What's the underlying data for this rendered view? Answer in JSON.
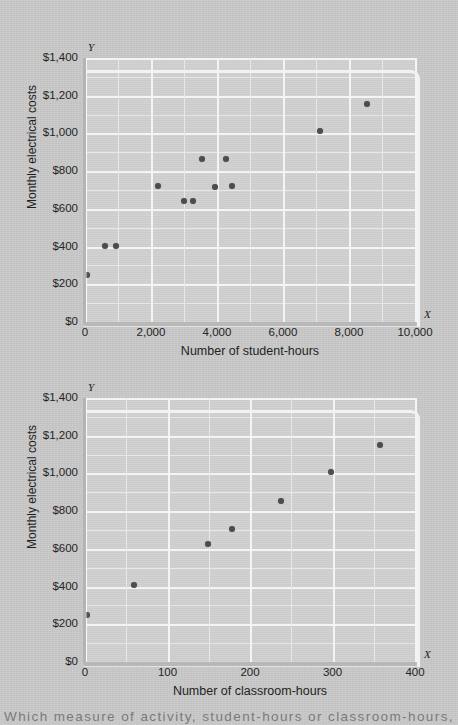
{
  "page": {
    "background_color": "#c9c9c9",
    "plot_background_color": "#d0d0d0",
    "gridline_color": "#f4f4f4",
    "dot_color": "#4d4d4d",
    "axis_color": "#b8b8b8"
  },
  "bottom_caption": "Which measure of activity, student-hours or classroom-hours, has a higher",
  "chart_data": [
    {
      "id": "chart-student-hours",
      "type": "scatter",
      "title": "",
      "xlabel": "Number of student-hours",
      "ylabel": "Monthly electrical costs",
      "x_axis_letter": "X",
      "y_axis_letter": "Y",
      "xlim": [
        0,
        10000
      ],
      "ylim": [
        0,
        1400
      ],
      "grid": true,
      "legend": "none",
      "xticks": [
        0,
        2000,
        4000,
        6000,
        8000,
        10000
      ],
      "xtick_labels": [
        "0",
        "2,000",
        "4,000",
        "6,000",
        "8,000",
        "10,000"
      ],
      "yticks": [
        0,
        200,
        400,
        600,
        800,
        1000,
        1200,
        1400
      ],
      "ytick_labels": [
        "$0",
        "$200",
        "$400",
        "$600",
        "$800",
        "$1,000",
        "$1,200",
        "$1,400"
      ],
      "y_minor_step": 100,
      "x_minor_step": 1000,
      "points": [
        {
          "x": 50,
          "y": 250
        },
        {
          "x": 620,
          "y": 405
        },
        {
          "x": 930,
          "y": 405
        },
        {
          "x": 2200,
          "y": 720
        },
        {
          "x": 3000,
          "y": 640
        },
        {
          "x": 3270,
          "y": 640
        },
        {
          "x": 3550,
          "y": 862
        },
        {
          "x": 3940,
          "y": 715
        },
        {
          "x": 4280,
          "y": 862
        },
        {
          "x": 4460,
          "y": 720
        },
        {
          "x": 7120,
          "y": 1012
        },
        {
          "x": 8550,
          "y": 1158
        }
      ]
    },
    {
      "id": "chart-classroom-hours",
      "type": "scatter",
      "title": "",
      "xlabel": "Number of classroom-hours",
      "ylabel": "Monthly electrical costs",
      "x_axis_letter": "X",
      "y_axis_letter": "Y",
      "xlim": [
        0,
        400
      ],
      "ylim": [
        0,
        1400
      ],
      "grid": true,
      "legend": "none",
      "xticks": [
        0,
        100,
        200,
        300,
        400
      ],
      "xtick_labels": [
        "0",
        "100",
        "200",
        "300",
        "400"
      ],
      "yticks": [
        0,
        200,
        400,
        600,
        800,
        1000,
        1200,
        1400
      ],
      "ytick_labels": [
        "$0",
        "$200",
        "$400",
        "$600",
        "$800",
        "$1,000",
        "$1,200",
        "$1,400"
      ],
      "y_minor_step": 100,
      "x_minor_step": 25,
      "points": [
        {
          "x": 2,
          "y": 250
        },
        {
          "x": 59,
          "y": 408
        },
        {
          "x": 149,
          "y": 625
        },
        {
          "x": 178,
          "y": 705
        },
        {
          "x": 238,
          "y": 855
        },
        {
          "x": 298,
          "y": 1010
        },
        {
          "x": 357,
          "y": 1152
        }
      ]
    }
  ]
}
